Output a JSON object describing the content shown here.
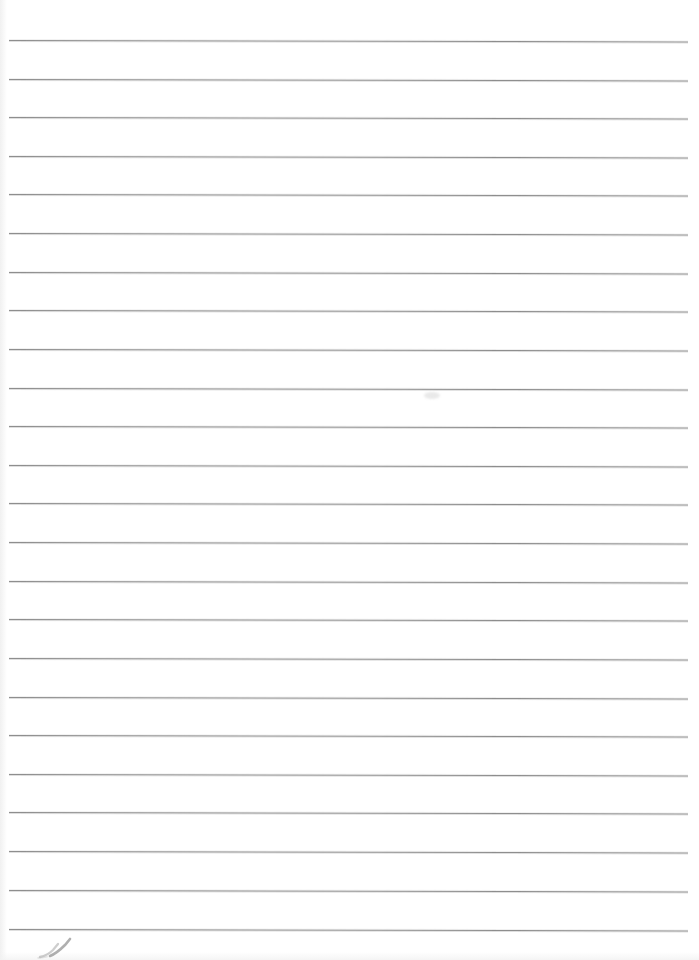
{
  "document": {
    "type": "scanned-ruled-notebook-page",
    "title": "Blank ruled notebook page",
    "page_width": 699,
    "page_height": 960,
    "background_color": "#ffffff",
    "text_content": "",
    "has_written_text": false
  },
  "ruling": {
    "line_color": "#8e8e8e",
    "line_thickness": 1,
    "line_count": 24,
    "line_start_x": 9,
    "line_end_x": 688,
    "first_line_y": 40,
    "last_line_y": 929,
    "line_spacing": 38.65,
    "skew_degrees": 0.12,
    "lines": [
      {
        "index": 1,
        "y": 40,
        "x1": 9,
        "x2": 688
      },
      {
        "index": 2,
        "y": 79,
        "x1": 9,
        "x2": 688
      },
      {
        "index": 3,
        "y": 117,
        "x1": 9,
        "x2": 688
      },
      {
        "index": 4,
        "y": 156,
        "x1": 9,
        "x2": 688
      },
      {
        "index": 5,
        "y": 194,
        "x1": 9,
        "x2": 688
      },
      {
        "index": 6,
        "y": 233,
        "x1": 9,
        "x2": 688
      },
      {
        "index": 7,
        "y": 272,
        "x1": 9,
        "x2": 688
      },
      {
        "index": 8,
        "y": 310,
        "x1": 9,
        "x2": 688
      },
      {
        "index": 9,
        "y": 349,
        "x1": 9,
        "x2": 688
      },
      {
        "index": 10,
        "y": 388,
        "x1": 9,
        "x2": 688
      },
      {
        "index": 11,
        "y": 426,
        "x1": 9,
        "x2": 688
      },
      {
        "index": 12,
        "y": 465,
        "x1": 9,
        "x2": 688
      },
      {
        "index": 13,
        "y": 503,
        "x1": 9,
        "x2": 688
      },
      {
        "index": 14,
        "y": 542,
        "x1": 9,
        "x2": 688
      },
      {
        "index": 15,
        "y": 581,
        "x1": 9,
        "x2": 688
      },
      {
        "index": 16,
        "y": 619,
        "x1": 9,
        "x2": 688
      },
      {
        "index": 17,
        "y": 658,
        "x1": 9,
        "x2": 688
      },
      {
        "index": 18,
        "y": 697,
        "x1": 9,
        "x2": 688
      },
      {
        "index": 19,
        "y": 735,
        "x1": 9,
        "x2": 688
      },
      {
        "index": 20,
        "y": 774,
        "x1": 9,
        "x2": 688
      },
      {
        "index": 21,
        "y": 812,
        "x1": 9,
        "x2": 688
      },
      {
        "index": 22,
        "y": 851,
        "x1": 9,
        "x2": 688
      },
      {
        "index": 23,
        "y": 890,
        "x1": 9,
        "x2": 688
      },
      {
        "index": 24,
        "y": 929,
        "x1": 9,
        "x2": 688
      }
    ]
  },
  "artifacts": {
    "pencil_mark": {
      "description": "faint diagonal double-stroke handwriting mark",
      "x": 36,
      "y": 936,
      "width": 48,
      "height": 24,
      "color": "#6f6f6f"
    },
    "smudge": {
      "description": "faint gray smudge on paper",
      "x": 424,
      "y": 392,
      "color": "#9b9b9b"
    }
  }
}
